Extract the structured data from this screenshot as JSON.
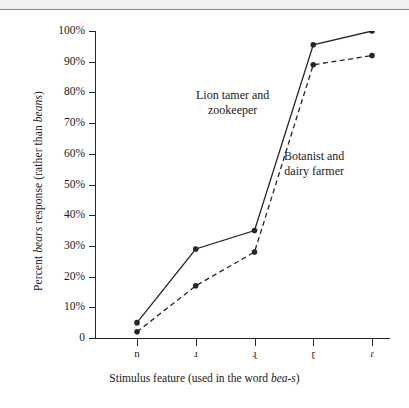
{
  "chart_data": {
    "type": "line",
    "title": "",
    "xlabel_parts": {
      "pre": "Stimulus feature (used in the word ",
      "italic": "bea-s",
      "post": ")"
    },
    "ylabel_parts": {
      "pre": "Percent ",
      "italic1": "bears",
      "mid": " response (rather than ",
      "italic2": "beans",
      "post": ")"
    },
    "categories": [
      "n",
      "ɹ",
      "ɻ",
      "ɽ",
      "ɾ"
    ],
    "ylim": [
      0,
      100
    ],
    "yticks": [
      0,
      10,
      20,
      30,
      40,
      50,
      60,
      70,
      80,
      90,
      100
    ],
    "ytick_labels": [
      "0",
      "10%",
      "20%",
      "30%",
      "40%",
      "50%",
      "60%",
      "70%",
      "80%",
      "90%",
      "100%"
    ],
    "grid": false,
    "legend_position": "inline-annotations",
    "series": [
      {
        "name": "Lion tamer and zookeeper",
        "style": "solid",
        "color": "#262626",
        "values": [
          5,
          29,
          35,
          95.5,
          100
        ]
      },
      {
        "name": "Botanist and dairy farmer",
        "style": "dashed",
        "color": "#262626",
        "values": [
          2,
          17,
          28,
          89,
          92
        ]
      }
    ],
    "annotations": [
      {
        "text_line1": "Lion tamer and",
        "text_line2": "zookeeper",
        "series": "Lion tamer and zookeeper"
      },
      {
        "text_line1": "Botanist and",
        "text_line2": "dairy farmer",
        "series": "Botanist and dairy farmer"
      }
    ]
  }
}
